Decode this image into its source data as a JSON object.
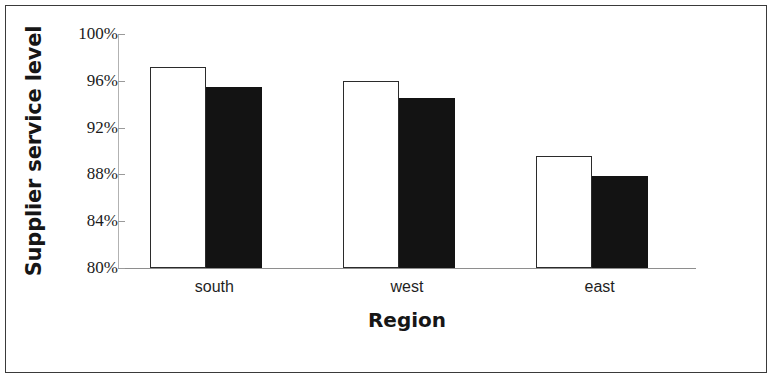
{
  "chart_data": {
    "type": "bar",
    "title": "",
    "xlabel": "Region",
    "ylabel": "Supplier service level",
    "categories": [
      "south",
      "west",
      "east"
    ],
    "series": [
      {
        "name": "series-1-white",
        "fill": "white",
        "values": [
          97.2,
          96.0,
          89.6
        ]
      },
      {
        "name": "series-2-black",
        "fill": "black",
        "values": [
          95.5,
          94.5,
          87.9
        ]
      }
    ],
    "ylim": [
      80,
      100
    ],
    "yticks": [
      80,
      84,
      88,
      92,
      96,
      100
    ],
    "ytick_labels": [
      "80%",
      "84%",
      "88%",
      "92%",
      "96%",
      "100%"
    ],
    "grid": false,
    "legend": "none",
    "value_suffix": "%"
  },
  "axes": {
    "y_title": "Supplier service level",
    "x_title": "Region"
  },
  "colors": {
    "open_bar_fill": "#ffffff",
    "open_bar_stroke": "#2b2b2b",
    "filled_bar": "#131313",
    "axis": "#8e8e8e",
    "text": "#1b1b1b",
    "border": "#3a3a3a"
  }
}
